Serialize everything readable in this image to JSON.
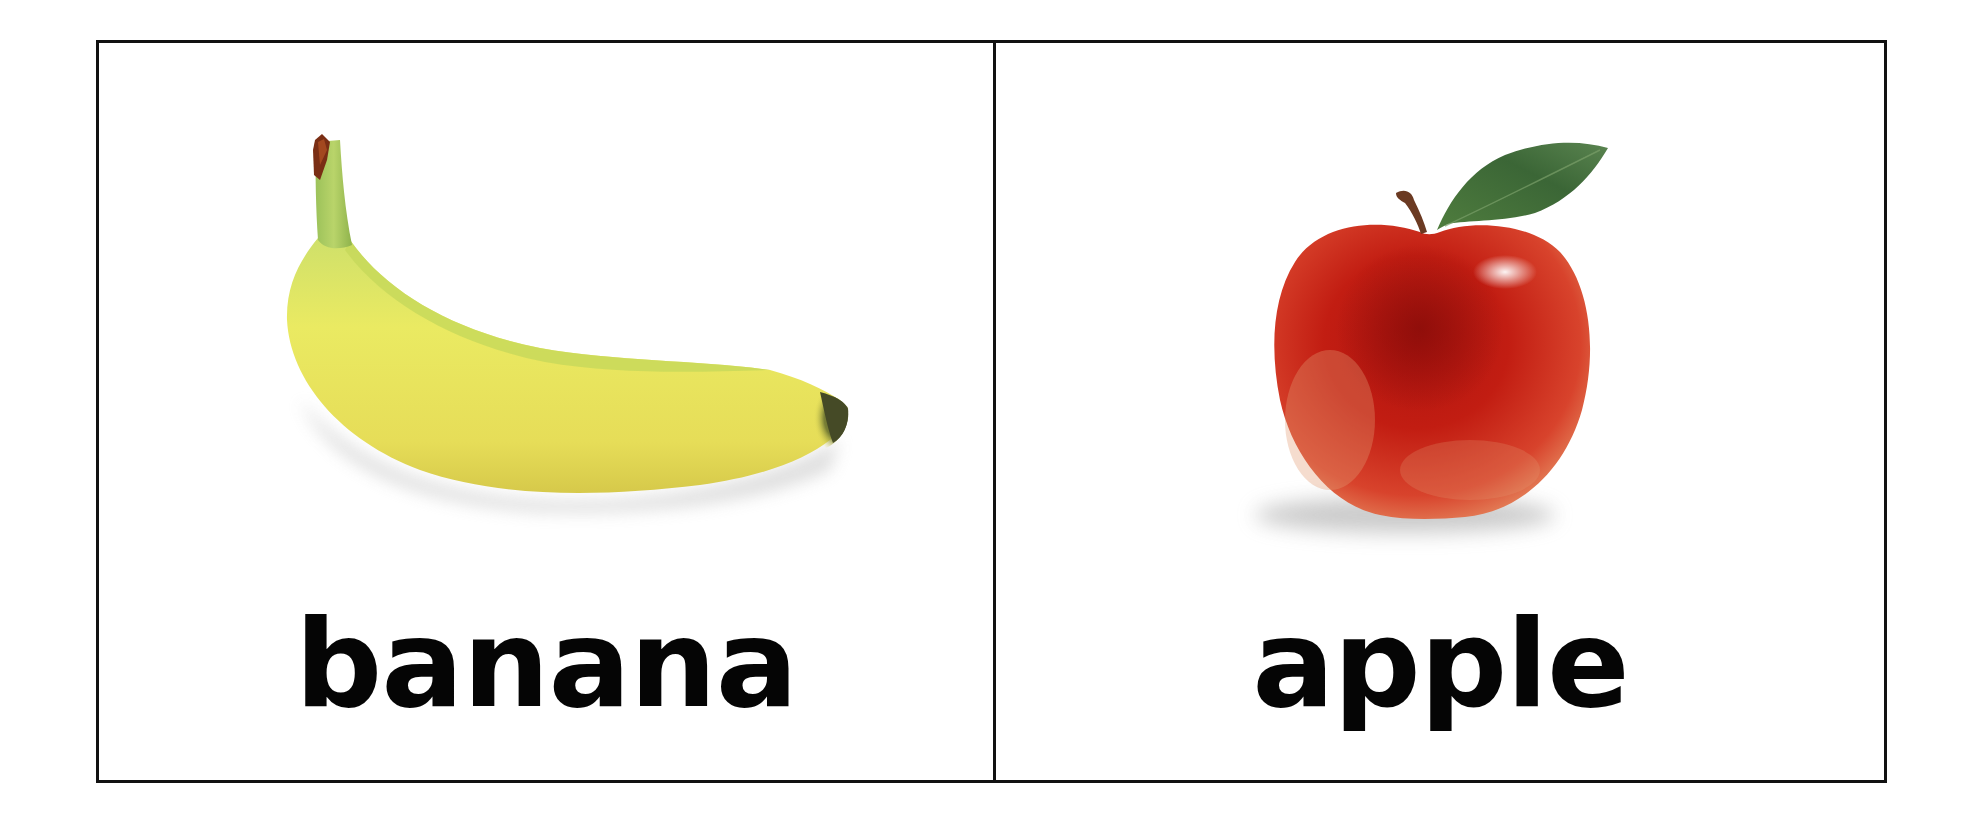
{
  "flashcards": [
    {
      "word": "banana",
      "image": "banana-illustration",
      "colors": {
        "peel": "#e8e35a",
        "stem": "#a9c95a",
        "tip": "#4a4f2a",
        "stem_end": "#7a2e14"
      }
    },
    {
      "word": "apple",
      "image": "apple-illustration",
      "colors": {
        "skin": "#c81e12",
        "skin_dark": "#8f0e0a",
        "leaf": "#3d6b3a",
        "stem": "#6b3a22"
      }
    }
  ],
  "style": {
    "border_color": "#111111",
    "text_color": "#050505",
    "background": "#ffffff"
  }
}
